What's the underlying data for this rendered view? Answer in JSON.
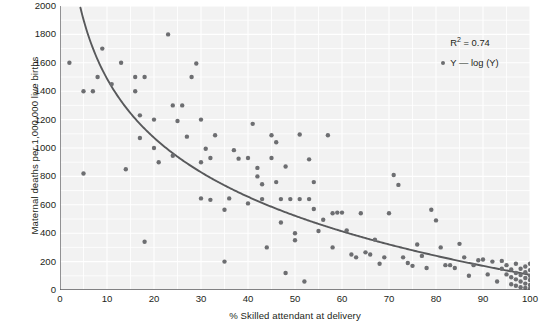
{
  "chart_data": {
    "type": "scatter",
    "title": "",
    "xlabel": "% Skilled attendant at delivery",
    "ylabel": "Maternal deaths per 1,000,000 live births",
    "xlim": [
      0,
      100
    ],
    "ylim": [
      0,
      2000
    ],
    "xticks": [
      0,
      10,
      20,
      30,
      40,
      50,
      60,
      70,
      80,
      90,
      100
    ],
    "yticks": [
      0,
      200,
      400,
      600,
      800,
      1000,
      1200,
      1400,
      1600,
      1800,
      2000
    ],
    "grid": true,
    "grid_minor_x_step": 5,
    "grid_minor_y_step": 100,
    "legend_position": "top-right",
    "annotations": {
      "r2_label": "R",
      "r2_sup": "2",
      "r2_value": "= 0.74",
      "series_label": "Y — log (Y)"
    },
    "series": [
      {
        "name": "Y — log (Y)",
        "marker": "circle",
        "color": "#6d6e71",
        "points": [
          [
            2,
            1600
          ],
          [
            5,
            1400
          ],
          [
            5,
            820
          ],
          [
            7,
            1400
          ],
          [
            8,
            1500
          ],
          [
            9,
            1700
          ],
          [
            11,
            1450
          ],
          [
            13,
            1600
          ],
          [
            14,
            850
          ],
          [
            16,
            1500
          ],
          [
            16,
            1400
          ],
          [
            17,
            1230
          ],
          [
            17,
            1070
          ],
          [
            18,
            340
          ],
          [
            18,
            1500
          ],
          [
            20,
            1200
          ],
          [
            20,
            1000
          ],
          [
            21,
            900
          ],
          [
            23,
            1800
          ],
          [
            24,
            945
          ],
          [
            24,
            1300
          ],
          [
            25,
            1190
          ],
          [
            26,
            1300
          ],
          [
            27,
            1080
          ],
          [
            28,
            1500
          ],
          [
            29,
            1595
          ],
          [
            30,
            900
          ],
          [
            30,
            645
          ],
          [
            30,
            1200
          ],
          [
            31,
            995
          ],
          [
            32,
            930
          ],
          [
            32,
            635
          ],
          [
            33,
            1090
          ],
          [
            35,
            200
          ],
          [
            35,
            565
          ],
          [
            36,
            645
          ],
          [
            37,
            985
          ],
          [
            38,
            925
          ],
          [
            40,
            610
          ],
          [
            40,
            930
          ],
          [
            41,
            1170
          ],
          [
            42,
            860
          ],
          [
            42,
            800
          ],
          [
            43,
            745
          ],
          [
            43,
            640
          ],
          [
            44,
            300
          ],
          [
            45,
            1090
          ],
          [
            45,
            930
          ],
          [
            46,
            1040
          ],
          [
            46,
            760
          ],
          [
            47,
            640
          ],
          [
            47,
            475
          ],
          [
            48,
            870
          ],
          [
            48,
            120
          ],
          [
            49,
            640
          ],
          [
            50,
            400
          ],
          [
            50,
            350
          ],
          [
            51,
            1095
          ],
          [
            51,
            640
          ],
          [
            52,
            60
          ],
          [
            53,
            920
          ],
          [
            53,
            640
          ],
          [
            54,
            570
          ],
          [
            54,
            760
          ],
          [
            55,
            415
          ],
          [
            56,
            495
          ],
          [
            57,
            1090
          ],
          [
            58,
            540
          ],
          [
            58,
            300
          ],
          [
            59,
            545
          ],
          [
            60,
            545
          ],
          [
            61,
            420
          ],
          [
            62,
            250
          ],
          [
            63,
            230
          ],
          [
            64,
            540
          ],
          [
            65,
            265
          ],
          [
            66,
            250
          ],
          [
            67,
            355
          ],
          [
            68,
            185
          ],
          [
            69,
            230
          ],
          [
            70,
            540
          ],
          [
            71,
            810
          ],
          [
            72,
            740
          ],
          [
            73,
            230
          ],
          [
            74,
            190
          ],
          [
            75,
            170
          ],
          [
            76,
            320
          ],
          [
            77,
            240
          ],
          [
            78,
            155
          ],
          [
            79,
            565
          ],
          [
            80,
            490
          ],
          [
            81,
            300
          ],
          [
            82,
            175
          ],
          [
            83,
            175
          ],
          [
            84,
            155
          ],
          [
            85,
            325
          ],
          [
            86,
            230
          ],
          [
            87,
            100
          ],
          [
            88,
            175
          ],
          [
            89,
            210
          ],
          [
            90,
            215
          ],
          [
            91,
            110
          ],
          [
            92,
            200
          ],
          [
            93,
            60
          ],
          [
            94,
            150
          ],
          [
            94,
            205
          ],
          [
            95,
            110
          ],
          [
            95,
            175
          ],
          [
            96,
            40
          ],
          [
            96,
            90
          ],
          [
            96,
            145
          ],
          [
            97,
            30
          ],
          [
            97,
            75
          ],
          [
            97,
            120
          ],
          [
            97,
            185
          ],
          [
            98,
            20
          ],
          [
            98,
            60
          ],
          [
            98,
            105
          ],
          [
            98,
            150
          ],
          [
            99,
            15
          ],
          [
            99,
            45
          ],
          [
            99,
            85
          ],
          [
            99,
            125
          ],
          [
            99,
            165
          ],
          [
            100,
            10
          ],
          [
            100,
            35
          ],
          [
            100,
            70
          ],
          [
            100,
            100
          ],
          [
            100,
            140
          ],
          [
            100,
            185
          ]
        ]
      }
    ],
    "fit_curve": {
      "name": "log fit",
      "color": "#58595b",
      "form": "y = a - b*ln(x)",
      "a": 2870,
      "b": 600,
      "r_squared": 0.74
    }
  }
}
